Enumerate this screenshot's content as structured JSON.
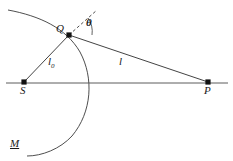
{
  "figure": {
    "type": "geometry-diagram",
    "background_color": "#ffffff",
    "stroke_color": "#333333",
    "points": [
      {
        "id": "S",
        "label": "S",
        "x": 24,
        "y": 82,
        "marker": "filled-square"
      },
      {
        "id": "Q",
        "label": "Q",
        "x": 69,
        "y": 35,
        "marker": "filled-square"
      },
      {
        "id": "P",
        "label": "P",
        "x": 208,
        "y": 82,
        "marker": "filled-square"
      }
    ],
    "segments": [
      {
        "id": "axis-SP",
        "from": "S",
        "to": "P",
        "style": "solid",
        "label": ""
      },
      {
        "id": "ray-SQ",
        "from": "S",
        "to": "Q",
        "style": "solid",
        "label": "l0"
      },
      {
        "id": "ray-QP",
        "from": "Q",
        "to": "P",
        "style": "solid",
        "label": "l"
      },
      {
        "id": "normal-at-Q",
        "from": "Q",
        "to": "normal-tip",
        "style": "dashed",
        "label": ""
      }
    ],
    "labels": {
      "source_point": "S",
      "scatter_point": "Q",
      "observation_point": "P",
      "wavefront": "M",
      "distance_source": "l",
      "distance_source_subscript": "0",
      "distance_observation": "l",
      "angle": "θ"
    },
    "arc": {
      "id": "wavefront-M",
      "label": "M",
      "style": "solid",
      "description": "circular arc passing near Q, crossing the axis and sweeping to lower left"
    },
    "angle_arc": {
      "id": "theta-arc",
      "vertex": "Q",
      "between": [
        "normal-at-Q",
        "ray-QP"
      ],
      "label": "θ"
    }
  }
}
